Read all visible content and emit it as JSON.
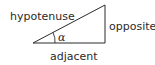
{
  "diagram": {
    "labels": {
      "hypotenuse": "hypotenuse",
      "opposite": "opposite",
      "adjacent": "adjacent",
      "angle": "α"
    },
    "colors": {
      "stroke": "#2a2a2a",
      "text": "#2a2a2a",
      "background": "#ffffff"
    }
  }
}
